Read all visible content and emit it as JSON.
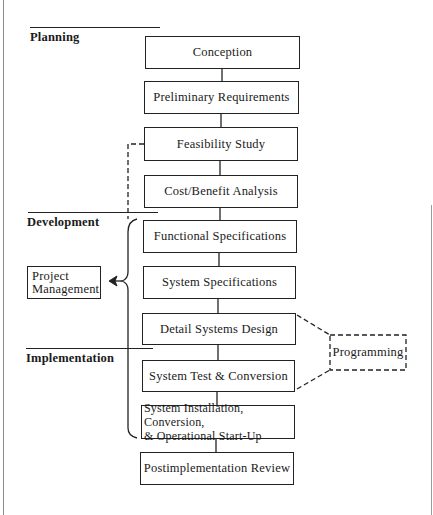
{
  "diagram": {
    "phases": [
      {
        "id": "planning",
        "label": "Planning"
      },
      {
        "id": "development",
        "label": "Development"
      },
      {
        "id": "implementation",
        "label": "Implementation"
      }
    ],
    "steps": [
      {
        "id": "conception",
        "label": "Conception"
      },
      {
        "id": "preliminary-requirements",
        "label": "Preliminary Requirements"
      },
      {
        "id": "feasibility-study",
        "label": "Feasibility Study"
      },
      {
        "id": "cost-benefit-analysis",
        "label": "Cost/Benefit Analysis"
      },
      {
        "id": "functional-specifications",
        "label": "Functional Specifications"
      },
      {
        "id": "system-specifications",
        "label": "System Specifications"
      },
      {
        "id": "detail-systems-design",
        "label": "Detail Systems Design"
      },
      {
        "id": "system-test-conversion",
        "label": "System Test & Conversion"
      },
      {
        "id": "system-installation",
        "label": "System Installation, Conversion,\n& Operational Start-Up"
      },
      {
        "id": "postimplementation-review",
        "label": "Postimplementation Review"
      }
    ],
    "side_boxes": {
      "project_management": {
        "label": "Project\nManagement"
      },
      "programming": {
        "label": "Programming"
      }
    },
    "colors": {
      "stroke": "#222222",
      "background": "#ffffff",
      "frame": "#8a8a8a"
    }
  }
}
